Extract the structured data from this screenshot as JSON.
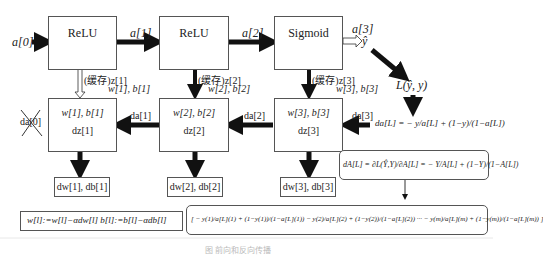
{
  "forward": {
    "input": "a[0]",
    "layers": [
      {
        "activation": "ReLU",
        "output": "a[1]"
      },
      {
        "activation": "ReLU",
        "output": "a[2]"
      },
      {
        "activation": "Sigmoid",
        "output": "a[3]"
      }
    ],
    "yhat": "ŷ",
    "loss": "L(ŷ, y)"
  },
  "cache": [
    {
      "label": "(缓存)z[1]",
      "params": "w[1], b[1]"
    },
    {
      "label": "(缓存)z[2]",
      "params": "w[2], b[2]"
    },
    {
      "label": "(缓存)z[3]",
      "params": "w[3], b[3]"
    }
  ],
  "backward": {
    "boxes": [
      {
        "params": "w[1], b[1]",
        "dz": "dz[1]"
      },
      {
        "params": "w[2], b[2]",
        "dz": "dz[2]"
      },
      {
        "params": "w[3], b[3]",
        "dz": "dz[3]"
      }
    ],
    "da_labels": [
      "da[1]",
      "da[2]",
      "da[3]"
    ],
    "da0_crossed": "da[0]",
    "grads": [
      "dw[1], db[1]",
      "dw[2], db[2]",
      "dw[3], db[3]"
    ]
  },
  "formulas": {
    "daL": "da[L] = − y/a[L] + (1−y)/(1−a[L])",
    "dAL": "dA[L] = ∂L(Ŷ,Y)/∂A[L] = − Y/A[L] + (1−Y)/(1−A[L])",
    "vectorized": "[ − y(1)/a[L](1) + (1−y(1))/(1−a[L](1))   − y(2)/a[L](2) + (1−y(2))/(1−a[L](2))  ···  − y(m)/a[L](m) + (1−y(m))/(1−a[L](m)) ]",
    "update": "w[l]:=w[l]−αdw[l]      b[l]:=b[l]−αdb[l]"
  },
  "caption": "图 前向和反向传播"
}
